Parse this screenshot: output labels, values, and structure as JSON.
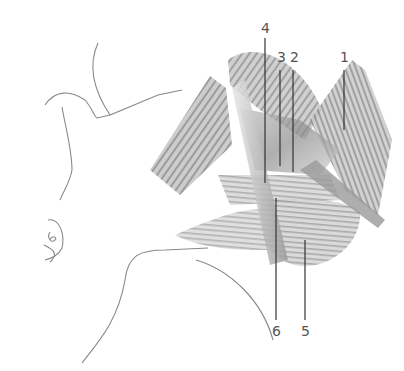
{
  "figure": {
    "labels": [
      {
        "id": "1",
        "text": "1",
        "x": 340,
        "y": 50
      },
      {
        "id": "2",
        "text": "2",
        "x": 290,
        "y": 50
      },
      {
        "id": "3",
        "text": "3",
        "x": 277,
        "y": 50
      },
      {
        "id": "4",
        "text": "4",
        "x": 261,
        "y": 21
      },
      {
        "id": "5",
        "text": "5",
        "x": 301,
        "y": 324
      },
      {
        "id": "6",
        "text": "6",
        "x": 272,
        "y": 324
      }
    ]
  }
}
